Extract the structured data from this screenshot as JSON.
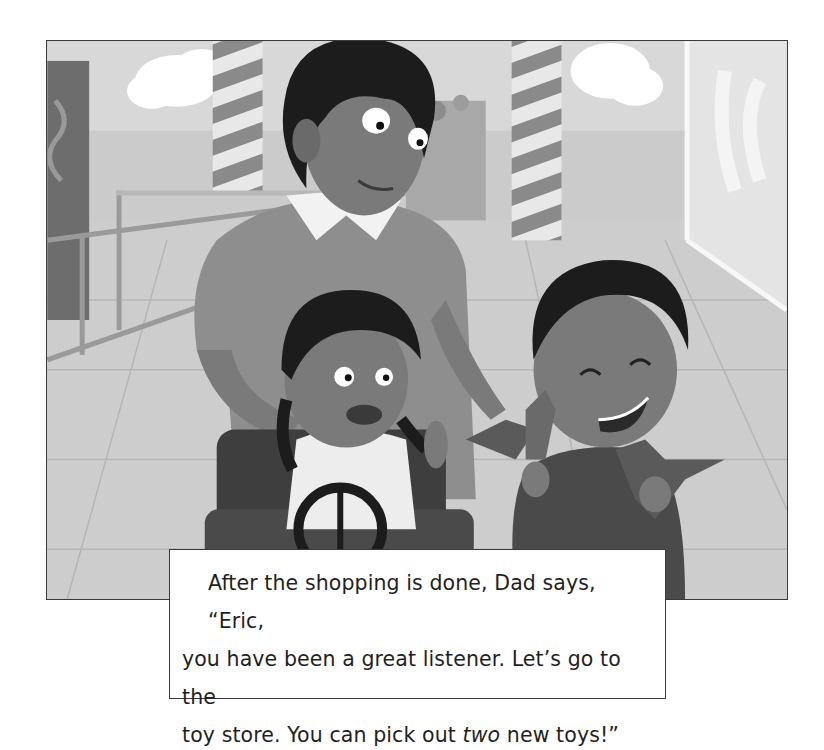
{
  "page": {
    "illustration": {
      "alt": "Dad pushing a shopping cart in a mall; a girl sits in the cart seat holding a toy steering wheel and waving, while Eric laughs holding two toy dinosaurs",
      "characters": [
        "Dad",
        "girl in cart",
        "Eric"
      ],
      "colors": {
        "background_wall": "#d6d6d6",
        "floor": "#c9c9c9",
        "hair": "#1c1c1c",
        "skin": "#7a7a7a",
        "dad_shirt": "#8e8e8e",
        "collar": "#f2f2f2",
        "eric_shirt": "#4a4a4a",
        "cart": "#3e3e3e",
        "cloud": "#ffffff",
        "pillar_stripe_dark": "#8a8a8a",
        "pillar_stripe_light": "#e8e8e8"
      }
    },
    "story_text": {
      "line1_before": "After the shopping is done, Dad says, “Eric,",
      "line2": "you have been a great listener. Let’s go to the",
      "line3_before": "toy store. You can pick out ",
      "line3_emphasis": "two",
      "line3_after": " new toys!”"
    }
  }
}
